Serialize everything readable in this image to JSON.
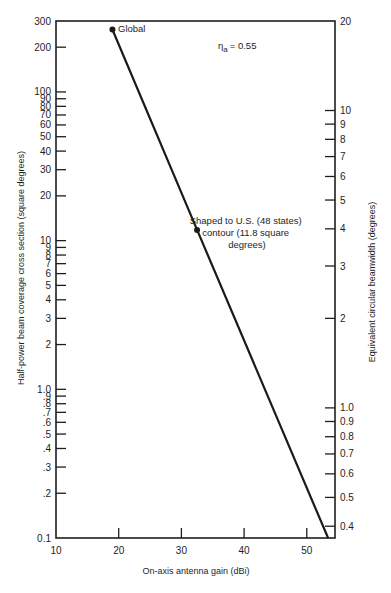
{
  "chart_data": {
    "type": "line",
    "title": "",
    "xlabel": "On-axis antenna gain (dBi)",
    "ylabel": "Half-power beam coverage cross section (square degrees)",
    "y2label": "Equivalent circular beamwidth (degrees)",
    "xlim": [
      10,
      54.5
    ],
    "ylim": [
      0.1,
      300
    ],
    "yscale": "log",
    "grid": false,
    "x_ticks": [
      {
        "value": 10,
        "label": "10"
      },
      {
        "value": 20,
        "label": "20"
      },
      {
        "value": 30,
        "label": "30"
      },
      {
        "value": 40,
        "label": "40"
      },
      {
        "value": 50,
        "label": "50"
      }
    ],
    "y_ticks": [
      {
        "value": 300,
        "label": "300"
      },
      {
        "value": 200,
        "label": "200"
      },
      {
        "value": 100,
        "label": "100"
      },
      {
        "value": 90,
        "label": "90"
      },
      {
        "value": 80,
        "label": "80"
      },
      {
        "value": 70,
        "label": "70"
      },
      {
        "value": 60,
        "label": "60"
      },
      {
        "value": 50,
        "label": "50"
      },
      {
        "value": 40,
        "label": "40"
      },
      {
        "value": 30,
        "label": "30"
      },
      {
        "value": 20,
        "label": "20"
      },
      {
        "value": 10,
        "label": "10"
      },
      {
        "value": 9,
        "label": "9"
      },
      {
        "value": 8,
        "label": "8"
      },
      {
        "value": 7,
        "label": "7"
      },
      {
        "value": 6,
        "label": "6"
      },
      {
        "value": 5,
        "label": "5"
      },
      {
        "value": 4,
        "label": "4"
      },
      {
        "value": 3,
        "label": "3"
      },
      {
        "value": 2,
        "label": "2"
      },
      {
        "value": 1.0,
        "label": "1.0"
      },
      {
        "value": 0.9,
        "label": ".9"
      },
      {
        "value": 0.8,
        "label": ".8"
      },
      {
        "value": 0.7,
        "label": ".7"
      },
      {
        "value": 0.6,
        "label": ".6"
      },
      {
        "value": 0.5,
        "label": ".5"
      },
      {
        "value": 0.4,
        "label": ".4"
      },
      {
        "value": 0.3,
        "label": ".3"
      },
      {
        "value": 0.2,
        "label": ".2"
      },
      {
        "value": 0.1,
        "label": "0.1"
      }
    ],
    "y2_ticks": [
      {
        "value": 20,
        "label": "20",
        "y_equiv": 300
      },
      {
        "value": 10,
        "label": "10"
      },
      {
        "value": 9,
        "label": "9"
      },
      {
        "value": 8,
        "label": "8"
      },
      {
        "value": 7,
        "label": "7"
      },
      {
        "value": 6,
        "label": "6"
      },
      {
        "value": 5,
        "label": "5"
      },
      {
        "value": 4,
        "label": "4"
      },
      {
        "value": 3,
        "label": "3"
      },
      {
        "value": 2,
        "label": "2"
      },
      {
        "value": 1.0,
        "label": "1.0"
      },
      {
        "value": 0.9,
        "label": "0.9"
      },
      {
        "value": 0.8,
        "label": "0.8"
      },
      {
        "value": 0.7,
        "label": "0.7"
      },
      {
        "value": 0.6,
        "label": "0.6"
      },
      {
        "value": 0.5,
        "label": "0.5"
      },
      {
        "value": 0.4,
        "label": "0.4"
      }
    ],
    "series": [
      {
        "name": "Coverage vs gain",
        "x": [
          19,
          32.5,
          53.4
        ],
        "y": [
          263,
          11.8,
          0.1
        ]
      }
    ],
    "points": [
      {
        "label": "Global",
        "x": 19,
        "y": 263
      },
      {
        "label": "Shaped to U.S. (48 states) contour (11.8 square degrees)",
        "x": 32.5,
        "y": 11.8
      }
    ],
    "annotations": [
      {
        "text": "η",
        "sub": "a",
        "value": "= 0.55"
      },
      {
        "text": "Global"
      },
      {
        "lines": [
          "Shaped to U.S. (48 states)",
          "contour (11.8 square",
          "degrees)"
        ]
      }
    ]
  }
}
